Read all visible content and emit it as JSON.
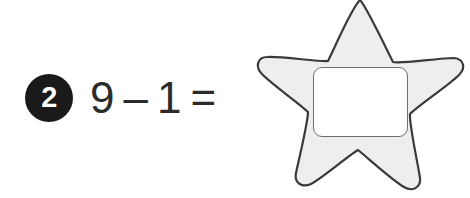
{
  "problem": {
    "number": "2",
    "equation": {
      "left_operand": "9",
      "operator": "–",
      "right_operand": "1",
      "equals": "=",
      "full_text": "9 – 1 ="
    },
    "answer_value": ""
  },
  "answer_area": {
    "shape": "star",
    "star_fill": "#eeeeee",
    "star_outline": "#3a3a3a",
    "box_fill": "#ffffff",
    "box_outline": "#6e6e6e"
  },
  "colors": {
    "badge_background": "#1a1a1a",
    "badge_text": "#ffffff",
    "equation_text": "#2b2b2b",
    "page_background": "#ffffff"
  }
}
